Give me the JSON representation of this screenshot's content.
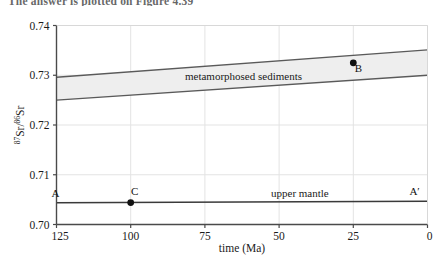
{
  "caption": {
    "text": "The answer is plotted on Figure 4.39"
  },
  "chart_data": {
    "type": "line",
    "title": "",
    "xlabel": "time (Ma)",
    "ylabel": "87Sr/86Sr",
    "ylabel_parts": {
      "sup1": "87",
      "mid": "Sr/",
      "sup2": "86",
      "tail": "Sr"
    },
    "xlim": [
      125,
      0
    ],
    "ylim": [
      0.7,
      0.74
    ],
    "x_ticks": [
      125,
      100,
      75,
      50,
      25,
      0
    ],
    "x_tick_labels": [
      "125",
      "100",
      "75",
      "50",
      "25",
      "0"
    ],
    "y_ticks": [
      0.7,
      0.71,
      0.72,
      0.73,
      0.74
    ],
    "y_tick_labels": [
      "0.70",
      "0.71",
      "0.72",
      "0.73",
      "0.74"
    ],
    "x_axis_reversed": true,
    "grid": true,
    "legend_position": "none",
    "bands": [
      {
        "name": "metamorphosed sediments",
        "label": "metamorphosed sediments",
        "label_x": 62,
        "label_y": 0.7298,
        "fill": "#eeeeee",
        "stroke": "#5a5a5a",
        "upper": {
          "x": [
            125,
            0
          ],
          "y": [
            0.7296,
            0.7351
          ]
        },
        "lower": {
          "x": [
            125,
            0
          ],
          "y": [
            0.725,
            0.73
          ]
        }
      }
    ],
    "series": [
      {
        "name": "upper mantle",
        "label": "upper mantle",
        "label_x": 43,
        "label_y": 0.7064,
        "color": "#3a3a3a",
        "x": [
          125,
          0
        ],
        "y": [
          0.70435,
          0.70465
        ]
      }
    ],
    "points": [
      {
        "name": "A",
        "label": "A",
        "x": 125,
        "y": 0.70435,
        "marker": false,
        "label_dx": -1,
        "label_dy": -6
      },
      {
        "name": "C",
        "label": "C",
        "x": 100,
        "y": 0.70441,
        "marker": true,
        "label_dx": 4,
        "label_dy": -8
      },
      {
        "name": "Ap",
        "label": "A′",
        "x": 3,
        "y": 0.70464,
        "marker": false,
        "label_dx": -4,
        "label_dy": -6
      },
      {
        "name": "B",
        "label": "B",
        "x": 25,
        "y": 0.7325,
        "marker": true,
        "label_dx": 5,
        "label_dy": 9
      }
    ],
    "colors": {
      "axis": "#4a4a4a",
      "grid": "#e3e3e3",
      "band_fill": "#eeeeee",
      "band_stroke": "#5a5a5a",
      "mantle_line": "#3a3a3a",
      "marker": "#111111",
      "text": "#1a1a1a",
      "background": "#ffffff"
    }
  }
}
